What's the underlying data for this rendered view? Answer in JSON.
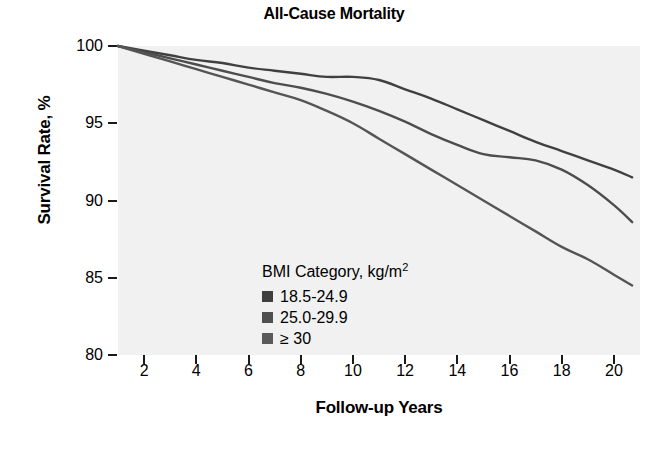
{
  "chart_data": {
    "type": "line",
    "title": "All-Cause Mortality",
    "xlabel": "Follow-up Years",
    "ylabel": "Survival Rate, %",
    "xlim": [
      1,
      21
    ],
    "ylim": [
      80,
      100
    ],
    "xticks": [
      2,
      4,
      6,
      8,
      10,
      12,
      14,
      16,
      18,
      20
    ],
    "yticks": [
      100,
      95,
      90,
      85,
      80
    ],
    "grid": false,
    "legend_position": "inside-left",
    "legend_title": "BMI Category, kg/m",
    "legend_title_superscript": "2",
    "x": [
      1,
      2,
      3,
      4,
      5,
      6,
      7,
      8,
      9,
      10,
      11,
      12,
      13,
      14,
      15,
      16,
      17,
      18,
      19,
      20,
      20.7
    ],
    "series": [
      {
        "name": "18.5-24.9",
        "color": "#404040",
        "values": [
          100.0,
          99.7,
          99.4,
          99.1,
          98.9,
          98.6,
          98.4,
          98.2,
          98.0,
          98.0,
          97.8,
          97.2,
          96.6,
          95.9,
          95.2,
          94.5,
          93.8,
          93.2,
          92.6,
          92.0,
          91.5
        ]
      },
      {
        "name": "25.0-29.9",
        "color": "#4d4d4d",
        "values": [
          100.0,
          99.6,
          99.2,
          98.8,
          98.4,
          98.0,
          97.6,
          97.3,
          96.9,
          96.4,
          95.8,
          95.1,
          94.3,
          93.6,
          93.0,
          92.8,
          92.6,
          92.0,
          91.0,
          89.7,
          88.6
        ]
      },
      {
        "name": "≥ 30",
        "color": "#555555",
        "values": [
          100.0,
          99.5,
          99.0,
          98.5,
          98.0,
          97.5,
          97.0,
          96.5,
          95.8,
          95.0,
          94.0,
          93.0,
          92.0,
          91.0,
          90.0,
          89.0,
          88.0,
          87.0,
          86.2,
          85.2,
          84.5
        ]
      }
    ]
  },
  "legend": {
    "title": "BMI Category, kg/m",
    "title_superscript": "2",
    "entries": [
      {
        "label": "18.5-24.9",
        "color": "#3f3f3f"
      },
      {
        "label": "25.0-29.9",
        "color": "#4f4f4f"
      },
      {
        "label": "≥ 30",
        "color": "#5a5a5a"
      }
    ]
  },
  "axes": {
    "y_tick_labels": [
      "100",
      "95",
      "90",
      "85",
      "80"
    ],
    "x_tick_labels": [
      "2",
      "4",
      "6",
      "8",
      "10",
      "12",
      "14",
      "16",
      "18",
      "20"
    ]
  },
  "colors": {
    "plot_background": "#f1f1f1",
    "page_background": "#ffffff",
    "axis": "#1a1a1a",
    "text": "#000000"
  }
}
